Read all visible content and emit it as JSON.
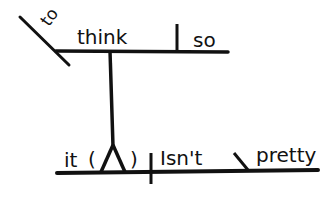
{
  "diagram": {
    "type": "sentence-diagram",
    "sentence": "I think so; to think it isn't pretty",
    "stroke_color": "#111111",
    "background": "#ffffff",
    "top_clause": {
      "subject_modifier": "to",
      "verb": "think",
      "object": "so"
    },
    "bottom_clause": {
      "subject": "it",
      "subject_marker": "( )",
      "verb": "Isn't",
      "complement": "pretty"
    }
  }
}
